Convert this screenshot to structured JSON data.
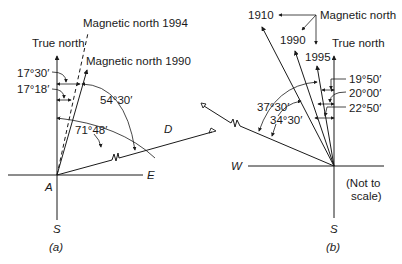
{
  "figure_a": {
    "caption": "(a)",
    "labels": {
      "true_north": "True north",
      "magnetic_north_1994": "Magnetic north 1994",
      "magnetic_north_1990": "Magnetic north 1990",
      "origin": "A",
      "east": "E",
      "south": "S",
      "point_d": "D"
    },
    "angles": {
      "a1": "17°30′",
      "a2": "17°18′",
      "a3": "54°30′",
      "a4": "71°48′"
    }
  },
  "figure_b": {
    "caption": "(b)",
    "labels": {
      "magnetic_north": "Magnetic north",
      "year_1910": "1910",
      "year_1990": "1990",
      "year_1995": "1995",
      "true_north": "True north",
      "west": "W",
      "south": "S",
      "note_line1": "(Not to",
      "note_line2": "scale)"
    },
    "angles": {
      "b1": "19°50′",
      "b2": "20°00′",
      "b3": "22°50′",
      "b4": "37°30′",
      "b5": "34°30′"
    }
  },
  "colors": {
    "ink": "#1a1a1a",
    "background": "#ffffff"
  }
}
